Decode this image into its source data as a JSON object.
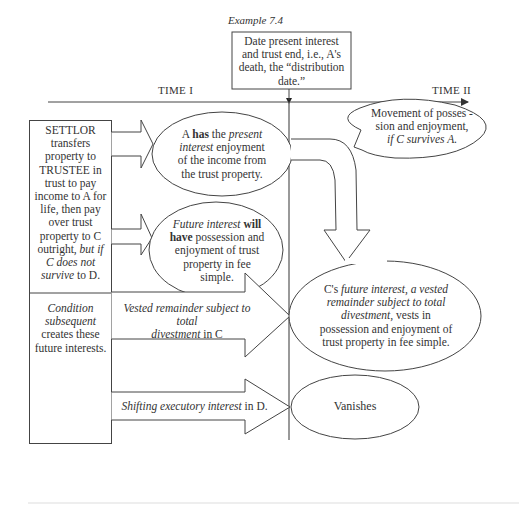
{
  "caption": "Example 7.4",
  "distribution_box": {
    "line1": "Date present interest",
    "line2": "and trust end, i.e., A's",
    "line3": "death, the “distribution",
    "line4": "date.”"
  },
  "timeline": {
    "time1": "TIME I",
    "time2": "TIME II"
  },
  "settlor_box": {
    "l1": "SETTLOR",
    "l2": "transfers",
    "l3": "property to",
    "l4": "TRUSTEE in",
    "l5": "trust to pay",
    "l6": "income to A for",
    "l7": "life, then pay",
    "l8": "over trust",
    "l9": "property to C",
    "l10a": "outright, ",
    "l10b": "but if",
    "l11": "C does not",
    "l12a": "survive",
    "l12b": " to D."
  },
  "condition_box": {
    "l1": "Condition",
    "l2": "subsequent",
    "l3": "creates these",
    "l4": "future interests."
  },
  "present_interest_ellipse": {
    "l1a": "A ",
    "l1b": "has",
    "l1c": " the ",
    "l1d": "present",
    "l2a": "interest",
    "l2b": " enjoyment",
    "l3": "of the income from",
    "l4": "the trust property."
  },
  "future_interest_ellipse": {
    "l1a": "Future interest",
    "l1b": " will",
    "l2a": "have",
    "l2b": " possession and",
    "l3": "enjoyment of trust",
    "l4": "property in fee",
    "l5": "simple."
  },
  "movement_bubble": {
    "l1": "Movement of posses -",
    "l2": "sion and enjoyment,",
    "l3": "if C survives A."
  },
  "vested_arrow": {
    "l1a": "Vested remainder subject to total",
    "l2a": "divestment",
    "l2b": " in C"
  },
  "c_future_ellipse": {
    "l1a": "C's ",
    "l1b": "future interest, a vested",
    "l2": "remainder subject to total",
    "l3a": "divestment,",
    "l3b": " vests in",
    "l4": "possession and enjoyment of",
    "l5": "trust property in fee simple."
  },
  "shifting_arrow": {
    "l1a": "Shifting executory interest",
    "l1b": " in D."
  },
  "vanishes_ellipse": {
    "label": "Vanishes"
  },
  "colors": {
    "stroke": "#444444",
    "text": "#333333",
    "background": "#ffffff"
  }
}
